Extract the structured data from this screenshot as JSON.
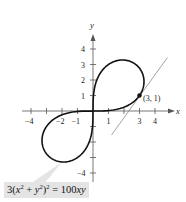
{
  "chart_data": {
    "type": "line",
    "title": "",
    "xlabel": "x",
    "ylabel": "y",
    "xlim": [
      -4.5,
      4.8
    ],
    "ylim": [
      -4.8,
      4.8
    ],
    "grid": false,
    "x_ticks": [
      -4,
      -3,
      -2,
      -1,
      1,
      2,
      3,
      4
    ],
    "x_tick_labels": [
      "-4",
      "-2",
      "-1",
      "1",
      "3",
      "4"
    ],
    "y_ticks": [
      -4,
      -3,
      -2,
      -1,
      1,
      2,
      3,
      4
    ],
    "y_tick_labels": [
      "1",
      "2",
      "3",
      "4",
      "-4"
    ],
    "equation": "3(x^2 + y^2)^2 = 100xy",
    "series": [
      {
        "name": "lemniscate",
        "description": "3(x^2+y^2)^2 = 100xy, polar r^2 = (50/3) sin 2θ",
        "color": "#111111"
      },
      {
        "name": "tangent line at (3, 1)",
        "points": [
          [
            1.2,
            -1.55
          ],
          [
            4.8,
            3.45
          ]
        ],
        "color": "#888888"
      }
    ],
    "annotations": [
      {
        "point": [
          3,
          1
        ],
        "label": "(3, 1)"
      }
    ]
  },
  "labels": {
    "x_axis": "x",
    "y_axis": "y",
    "point": "(3, 1)",
    "ticks_x": {
      "neg4": "−4",
      "neg2": "−2",
      "neg1": "−1",
      "pos1": "1",
      "pos3": "3",
      "pos4": "4"
    },
    "ticks_y": {
      "pos1": "1",
      "pos2": "2",
      "pos3": "3",
      "pos4": "4",
      "neg4": "−4"
    }
  },
  "equation": {
    "lead": "3(",
    "x": "x",
    "plus": " + ",
    "y": "y",
    "close": ")",
    "exp": "2",
    "eq": " = 100",
    "xy": "xy"
  }
}
